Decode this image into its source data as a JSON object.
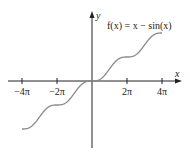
{
  "chart_data": {
    "type": "line",
    "title": "f(x) = x − sin(x)",
    "function": "x - sin(x)",
    "xlabel": "x",
    "ylabel": "y",
    "xlim": [
      -12.566,
      12.566
    ],
    "ylim": [
      -12.566,
      12.566
    ],
    "x_ticks": [
      -12.566,
      -6.283,
      6.283,
      12.566
    ],
    "x_tick_labels": [
      "−4π",
      "−2π",
      "2π",
      "4π"
    ],
    "grid": false,
    "legend": null,
    "series": [
      {
        "name": "f(x) = x − sin(x)",
        "x": [
          -12.566,
          -9.425,
          -6.283,
          -3.142,
          0,
          3.142,
          6.283,
          9.425,
          12.566
        ],
        "values": [
          -12.566,
          -8.425,
          -6.283,
          -3.142,
          0,
          3.142,
          6.283,
          10.425,
          12.566
        ],
        "color": "#8a8a8a"
      }
    ]
  },
  "labels": {
    "function": "f(x) = x − sin(x)",
    "x_axis": "x",
    "y_axis": "y",
    "ticks": [
      "−4π",
      "−2π",
      "2π",
      "4π"
    ]
  }
}
